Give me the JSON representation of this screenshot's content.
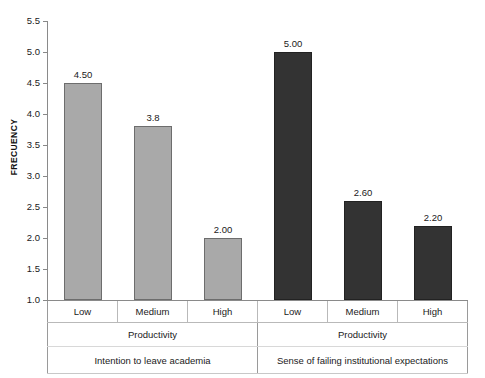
{
  "chart_data": {
    "type": "bar",
    "title": "",
    "xlabel": "Productivity",
    "ylabel": "FRECUENCY",
    "ylim": [
      1.0,
      5.5
    ],
    "ytick_labels": [
      "5.5",
      "5.0",
      "4.5",
      "4.0",
      "3.5",
      "3.0",
      "2.5",
      "2.0",
      "1.5",
      "1.0"
    ],
    "ytick_values": [
      5.5,
      5.0,
      4.5,
      4.0,
      3.5,
      3.0,
      2.5,
      2.0,
      1.5,
      1.0
    ],
    "grid": false,
    "legend": "none",
    "categories": [
      "Low",
      "Medium",
      "High"
    ],
    "groups": [
      {
        "name": "Intention to leave academia",
        "axis_label": "Productivity",
        "color": "#a9a9a9",
        "values": [
          4.5,
          3.8,
          2.0
        ],
        "value_labels": [
          "4.50",
          "3.8",
          "2.00"
        ]
      },
      {
        "name": "Sense of failing institutional expectations",
        "axis_label": "Productivity",
        "color": "#333333",
        "values": [
          5.0,
          2.6,
          2.2
        ],
        "value_labels": [
          "5.00",
          "2.60",
          "2.20"
        ]
      }
    ],
    "bars": [
      {
        "group": 0,
        "category": "Low",
        "value": 4.5,
        "label": "4.50",
        "style": "light"
      },
      {
        "group": 0,
        "category": "Medium",
        "value": 3.8,
        "label": "3.8",
        "style": "light"
      },
      {
        "group": 0,
        "category": "High",
        "value": 2.0,
        "label": "2.00",
        "style": "light"
      },
      {
        "group": 1,
        "category": "Low",
        "value": 5.0,
        "label": "5.00",
        "style": "dark"
      },
      {
        "group": 1,
        "category": "Medium",
        "value": 2.6,
        "label": "2.60",
        "style": "dark"
      },
      {
        "group": 1,
        "category": "High",
        "value": 2.2,
        "label": "2.20",
        "style": "dark"
      }
    ]
  },
  "colors": {
    "series_light": "#a9a9a9",
    "series_dark": "#333333",
    "axis": "#8a8a8a",
    "text": "#1a1a1a"
  }
}
